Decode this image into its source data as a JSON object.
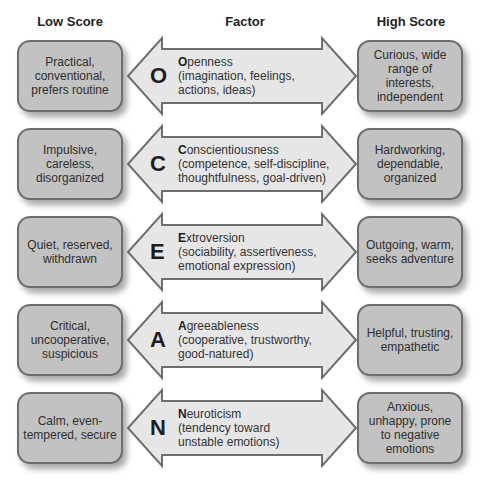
{
  "headers": {
    "low": "Low Score",
    "factor": "Factor",
    "high": "High Score"
  },
  "colors": {
    "box_fill": "#c2c2c2",
    "box_border": "#6d6d6d",
    "arrow_fill": "#e6e6e6",
    "arrow_border": "#6d6d6d"
  },
  "factors": [
    {
      "letter": "O",
      "initial": "O",
      "name_rest": "penness",
      "details": [
        "(imagination, feelings,",
        "actions, ideas)"
      ],
      "low": "Practical, conventional, prefers routine",
      "high": "Curious, wide range of interests, independent"
    },
    {
      "letter": "C",
      "initial": "C",
      "name_rest": "onscientiousness",
      "details": [
        "(competence, self-discipline,",
        "thoughtfulness, goal-driven)"
      ],
      "low": "Impulsive, careless, disorganized",
      "high": "Hardworking, dependable, organized"
    },
    {
      "letter": "E",
      "initial": "E",
      "name_rest": "xtroversion",
      "details": [
        "(sociability, assertiveness,",
        "emotional expression)"
      ],
      "low": "Quiet, reserved, withdrawn",
      "high": "Outgoing, warm, seeks adventure"
    },
    {
      "letter": "A",
      "initial": "A",
      "name_rest": "greeableness",
      "details": [
        "(cooperative, trustworthy,",
        "good-natured)"
      ],
      "low": "Critical, uncooperative, suspicious",
      "high": "Helpful, trusting, empathetic"
    },
    {
      "letter": "N",
      "initial": "N",
      "name_rest": "euroticism",
      "details": [
        "(tendency toward",
        "unstable emotions)"
      ],
      "low": "Calm, even-tempered, secure",
      "high": "Anxious, unhappy, prone to negative emotions"
    }
  ]
}
